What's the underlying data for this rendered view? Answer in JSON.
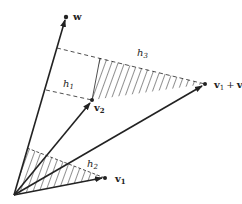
{
  "diagram": {
    "colors": {
      "ink": "#222222",
      "background": "#ffffff"
    },
    "vectors": [
      {
        "id": "w",
        "label": "w",
        "tip": [
          66,
          17
        ]
      },
      {
        "id": "v2",
        "label": "v",
        "sub": "2",
        "tip": [
          92,
          100
        ]
      },
      {
        "id": "v1_plus_v2",
        "label": "v",
        "sub": "1",
        "plus": "+",
        "label2": "v",
        "sub2": "2",
        "tip": [
          205,
          84
        ]
      },
      {
        "id": "v1",
        "label": "v",
        "sub": "1",
        "tip": [
          105,
          178
        ]
      }
    ],
    "heights": [
      {
        "id": "h1",
        "label": "h",
        "sub": "1"
      },
      {
        "id": "h2",
        "label": "h",
        "sub": "2"
      },
      {
        "id": "h3",
        "label": "h",
        "sub": "3"
      }
    ],
    "origin": [
      14,
      195
    ]
  }
}
